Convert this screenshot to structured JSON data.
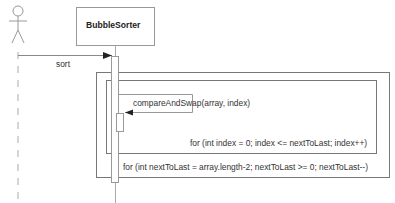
{
  "diagram": {
    "type": "sequence",
    "actor": {
      "name": "",
      "icon": "stick-figure-icon"
    },
    "participant": {
      "name": "BubbleSorter"
    },
    "messages": [
      {
        "from": "actor",
        "to": "BubbleSorter",
        "label": "sort"
      },
      {
        "from": "BubbleSorter",
        "to": "BubbleSorter",
        "label": "compareAndSwap(array, index)"
      }
    ],
    "fragments": [
      {
        "kind": "loop",
        "guard": "for (int nextToLast = array.length-2; nextToLast >= 0; nextToLast--)"
      },
      {
        "kind": "loop",
        "guard": "for (int index = 0; index <= nextToLast; index++)"
      }
    ],
    "colors": {
      "line": "#8a8a8a",
      "box": "#777777",
      "text": "#333333",
      "background": "#ffffff"
    }
  }
}
